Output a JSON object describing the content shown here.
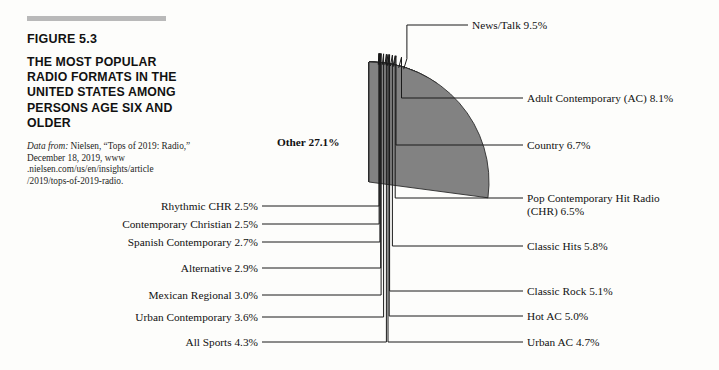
{
  "figure": {
    "number": "FIGURE 5.3",
    "title": "THE MOST POPULAR RADIO FORMATS IN THE UNITED STATES AMONG PERSONS AGE SIX AND OLDER",
    "source_prefix": "Data from:",
    "source_text": " Nielsen, “Tops of 2019: Radio,” December 18, 2019, www\n.nielsen.com/us/en/insights/article\n/2019/tops-of-2019-radio."
  },
  "chart_data": {
    "type": "pie",
    "title": "THE MOST POPULAR RADIO FORMATS IN THE UNITED STATES AMONG PERSONS AGE SIX AND OLDER",
    "unit": "percent",
    "start_angle_deg": 0,
    "direction": "clockwise",
    "legend": "callout-labels",
    "categories": [
      "News/Talk",
      "Adult Contemporary (AC)",
      "Country",
      "Pop Contemporary Hit Radio (CHR)",
      "Classic Hits",
      "Classic Rock",
      "Hot AC",
      "Urban AC",
      "All Sports",
      "Urban Contemporary",
      "Mexican Regional",
      "Alternative",
      "Spanish Contemporary",
      "Contemporary Christian",
      "Rhythmic CHR",
      "Other"
    ],
    "values": [
      9.5,
      8.1,
      6.7,
      6.5,
      5.8,
      5.1,
      5.0,
      4.7,
      4.3,
      3.6,
      3.0,
      2.9,
      2.7,
      2.5,
      2.5,
      27.1
    ],
    "colors": [
      "#8d8d8d",
      "#7e7e7e",
      "#5e5e5e",
      "#d2d2d2",
      "#3a3a3a",
      "#9a9a9a",
      "#c9c9c9",
      "#efefef",
      "#7a7a7a",
      "#9f9f9f",
      "#f2f2f2",
      "#484848",
      "#d6d6d6",
      "#ededed",
      "#8a8a8a",
      "#828282"
    ],
    "slice_labels": [
      "News/Talk 9.5%",
      "Adult Contemporary (AC) 8.1%",
      "Country 6.7%",
      "Pop Contemporary Hit Radio\n(CHR) 6.5%",
      "Classic Hits 5.8%",
      "Classic Rock 5.1%",
      "Hot AC 5.0%",
      "Urban AC 4.7%",
      "All Sports 4.3%",
      "Urban Contemporary 3.6%",
      "Mexican Regional 3.0%",
      "Alternative 2.9%",
      "Spanish Contemporary 2.7%",
      "Contemporary Christian 2.5%",
      "Rhythmic CHR 2.5%",
      "Other 27.1%"
    ]
  },
  "callouts": {
    "news_talk": "News/Talk 9.5%",
    "adult_contemporary": "Adult Contemporary (AC) 8.1%",
    "country": "Country 6.7%",
    "pop_chr": "Pop Contemporary Hit Radio\n(CHR) 6.5%",
    "classic_hits": "Classic Hits 5.8%",
    "classic_rock": "Classic Rock 5.1%",
    "hot_ac": "Hot AC 5.0%",
    "urban_ac": "Urban AC 4.7%",
    "all_sports": "All Sports 4.3%",
    "urban_contemporary": "Urban Contemporary 3.6%",
    "mexican_regional": "Mexican Regional 3.0%",
    "alternative": "Alternative 2.9%",
    "spanish_contemporary": "Spanish Contemporary 2.7%",
    "contemporary_christian": "Contemporary Christian 2.5%",
    "rhythmic_chr": "Rhythmic CHR 2.5%",
    "other": "Other 27.1%"
  }
}
